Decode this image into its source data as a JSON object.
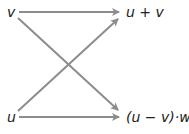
{
  "diagram": {
    "nodes": {
      "v": "v",
      "u": "u",
      "sum": "u + v",
      "prod": "(u − v)·w"
    },
    "edges": [
      {
        "from": "v",
        "to": "u + v"
      },
      {
        "from": "v",
        "to": "(u − v)·w"
      },
      {
        "from": "u",
        "to": "u + v"
      },
      {
        "from": "u",
        "to": "(u − v)·w"
      }
    ],
    "colors": {
      "arrow": "#8c8c8c",
      "text": "#222222"
    }
  }
}
